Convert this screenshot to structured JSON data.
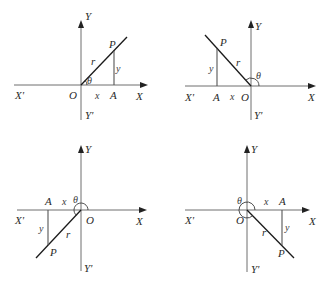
{
  "figure": {
    "colors": {
      "axis": "#6e6e6e",
      "radius": "#1a1a1a",
      "text": "#2a2a2a"
    },
    "panels": [
      {
        "quadrant": "I",
        "labels": {
          "x_pos": "X",
          "x_neg": "X'",
          "y_pos": "Y",
          "y_neg": "Y'",
          "origin": "O",
          "point": "P",
          "foot": "A",
          "radius": "r",
          "angle": "θ",
          "adjacent": "x",
          "opposite": "y"
        }
      },
      {
        "quadrant": "II",
        "labels": {
          "x_pos": "X",
          "x_neg": "X'",
          "y_pos": "Y",
          "y_neg": "Y'",
          "origin": "O",
          "point": "P",
          "foot": "A",
          "radius": "r",
          "angle": "θ",
          "adjacent": "x",
          "opposite": "y"
        }
      },
      {
        "quadrant": "III",
        "labels": {
          "x_pos": "X",
          "x_neg": "X'",
          "y_pos": "Y",
          "y_neg": "Y'",
          "origin": "O",
          "point": "P",
          "foot": "A",
          "radius": "r",
          "angle": "θ",
          "adjacent": "x",
          "opposite": "y"
        }
      },
      {
        "quadrant": "IV",
        "labels": {
          "x_pos": "X",
          "x_neg": "X'",
          "y_pos": "Y",
          "y_neg": "Y'",
          "origin": "O",
          "point": "P",
          "foot": "A",
          "radius": "r",
          "angle": "θ",
          "adjacent": "x",
          "opposite": "y"
        }
      }
    ]
  }
}
